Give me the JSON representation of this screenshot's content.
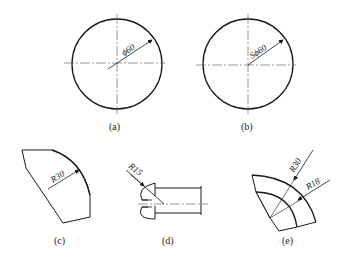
{
  "figures": [
    {
      "id": "a",
      "caption": "(a)",
      "dimension": "ϕ60",
      "type": "circle-diameter"
    },
    {
      "id": "b",
      "caption": "(b)",
      "dimension": "Sϕ60",
      "type": "sphere-diameter"
    },
    {
      "id": "c",
      "caption": "(c)",
      "dimension": "R30",
      "type": "arc-radius"
    },
    {
      "id": "d",
      "caption": "(d)",
      "dimension": "R15",
      "type": "screw-head-radius"
    },
    {
      "id": "e",
      "caption": "(e)",
      "dimensions": [
        "R30",
        "R18"
      ],
      "type": "concentric-arcs-radius"
    }
  ],
  "colors": {
    "line": "#1a1a1a",
    "centerline": "#555555",
    "background": "#ffffff"
  }
}
